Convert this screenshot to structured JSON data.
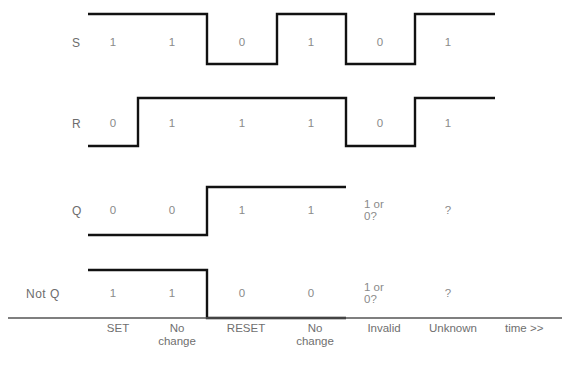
{
  "diagram": {
    "title_hidden": "",
    "line_color": "#111111",
    "text_color": "#8a8a8a",
    "label_color": "#6d6d6d",
    "axis_color": "#555555",
    "time_axis_label": "time >>"
  },
  "signals": [
    {
      "name": "S",
      "label": "S",
      "label_x": 72,
      "label_y": 36,
      "value_y": 36,
      "high_y": 14,
      "low_y": 64,
      "levels": [
        1,
        1,
        0,
        1,
        0,
        1
      ],
      "values": [
        "1",
        "1",
        "0",
        "1",
        "0",
        "1"
      ]
    },
    {
      "name": "R",
      "label": "R",
      "label_x": 72,
      "label_y": 117,
      "value_y": 117,
      "high_y": 98,
      "low_y": 146,
      "levels": [
        0,
        1,
        1,
        1,
        0,
        1
      ],
      "values": [
        "0",
        "1",
        "1",
        "1",
        "0",
        "1"
      ]
    },
    {
      "name": "Q",
      "label": "Q",
      "label_x": 72,
      "label_y": 204,
      "value_y": 204,
      "high_y": 187,
      "low_y": 235,
      "levels": [
        0,
        0,
        1,
        1,
        null,
        null
      ],
      "values": [
        "0",
        "0",
        "1",
        "1",
        "1 or\n0?",
        "?"
      ]
    },
    {
      "name": "Not Q",
      "label": "Not  Q",
      "label_x": 26,
      "label_y": 287,
      "value_y": 287,
      "high_y": 270,
      "low_y": 318,
      "levels": [
        1,
        1,
        0,
        0,
        null,
        null
      ],
      "values": [
        "1",
        "1",
        "0",
        "0",
        "1 or\n0?",
        "?"
      ]
    }
  ],
  "columns": {
    "boundaries": [
      88,
      138,
      207,
      277,
      346,
      415,
      495
    ],
    "centers": [
      113,
      172,
      242,
      311,
      380,
      448
    ]
  },
  "phases": [
    {
      "label": "SET",
      "x": 118,
      "y": 322
    },
    {
      "label": "No\nchange",
      "x": 177,
      "y": 322
    },
    {
      "label": "RESET",
      "x": 246,
      "y": 322
    },
    {
      "label": "No\nchange",
      "x": 315,
      "y": 322
    },
    {
      "label": "Invalid",
      "x": 384,
      "y": 322
    },
    {
      "label": "Unknown",
      "x": 453,
      "y": 322
    }
  ],
  "axis": {
    "y": 318,
    "x_start": 8,
    "x_end": 562,
    "time_label": "time >>",
    "time_label_x": 505,
    "time_label_y": 322
  }
}
